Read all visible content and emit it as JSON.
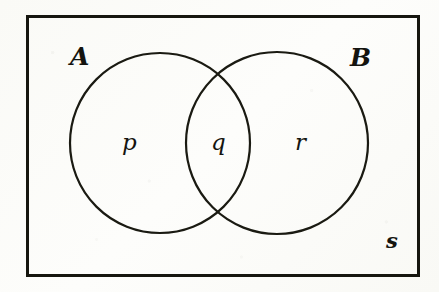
{
  "diagram": {
    "kind": "venn-diagram",
    "universe_border_color": "#16160f",
    "circle_stroke_color": "#1a1a12",
    "background_color": "#fdfdfb",
    "label_color": "#14140f",
    "universe": {
      "label": "s",
      "x": 26,
      "y": 15,
      "width": 394,
      "height": 262,
      "border_width": 3,
      "label_x": 386,
      "label_y": 230
    },
    "sets": [
      {
        "id": "set-a",
        "label": "A",
        "cx": 160,
        "cy": 143,
        "r": 90,
        "label_x": 70,
        "label_y": 44
      },
      {
        "id": "set-b",
        "label": "B",
        "cx": 277,
        "cy": 143,
        "r": 91,
        "label_x": 350,
        "label_y": 45
      }
    ],
    "regions": [
      {
        "id": "region-p",
        "label": "p",
        "meaning": "A only",
        "x": 122,
        "y": 131
      },
      {
        "id": "region-q",
        "label": "q",
        "meaning": "A intersect B",
        "x": 211,
        "y": 131
      },
      {
        "id": "region-r",
        "label": "r",
        "meaning": "B only",
        "x": 295,
        "y": 131
      }
    ]
  }
}
